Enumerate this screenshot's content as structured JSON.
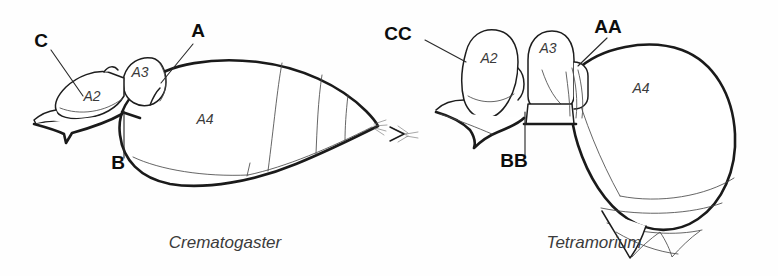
{
  "figure": {
    "background_color": "#fefefe",
    "ink_color": "#1a1a1a",
    "width": 778,
    "height": 276
  },
  "panels": [
    {
      "id": "left-panel",
      "genus": "Crematogaster",
      "caption_x": 225,
      "caption_y": 248,
      "segments": [
        {
          "key": "a2",
          "label": "A2",
          "x": 92,
          "y": 101
        },
        {
          "key": "a3",
          "label": "A3",
          "x": 140,
          "y": 77
        },
        {
          "key": "a4",
          "label": "A4",
          "x": 205,
          "y": 124
        }
      ],
      "callouts": [
        {
          "key": "a",
          "label": "A",
          "label_x": 198,
          "label_y": 37,
          "leader": "M 193 44 L 161 83"
        },
        {
          "key": "b",
          "label": "B",
          "label_x": 118,
          "label_y": 169,
          "leader": "M 124 158 L 124 111"
        },
        {
          "key": "c",
          "label": "C",
          "label_x": 41,
          "label_y": 47,
          "leader": "M 51 50 L 83 96"
        }
      ]
    },
    {
      "id": "right-panel",
      "genus": "Tetramorium",
      "caption_x": 594,
      "caption_y": 248,
      "segments": [
        {
          "key": "a2",
          "label": "A2",
          "x": 489,
          "y": 63
        },
        {
          "key": "a3",
          "label": "A3",
          "x": 548,
          "y": 53
        },
        {
          "key": "a4",
          "label": "A4",
          "x": 641,
          "y": 93
        }
      ],
      "callouts": [
        {
          "key": "aa",
          "label": "AA",
          "label_x": 608,
          "label_y": 33,
          "leader": "M 607 38 L 578 66"
        },
        {
          "key": "bb",
          "label": "BB",
          "label_x": 514,
          "label_y": 167,
          "leader": "M 525 155 L 525 112"
        },
        {
          "key": "cc",
          "label": "CC",
          "label_x": 398,
          "label_y": 40,
          "leader": "M 425 40 L 466 62"
        }
      ]
    }
  ]
}
